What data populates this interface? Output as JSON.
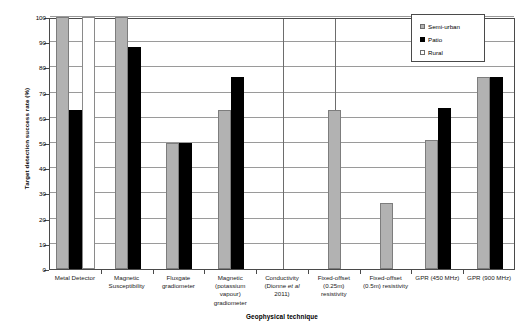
{
  "chart_data": {
    "type": "bar",
    "title": "",
    "xlabel": "Geophysical technique",
    "ylabel": "Target detection success rate (%)",
    "ylim": [
      0,
      100
    ],
    "ytick_step": 10,
    "yticks": [
      0,
      10,
      20,
      30,
      40,
      50,
      60,
      70,
      80,
      90,
      100
    ],
    "grid": true,
    "legend_position": "top-right",
    "categories": [
      "Metal Detector",
      "Magnetic Susceptibility",
      "Fluxgate gradiometer",
      "Magnetic (potassium vapour) gradiometer",
      "Conductivity (Dionne et al 2011)",
      "Fixed-offset (0.25m) resistivity",
      "Fixed-offset (0.5m) resistivity",
      "GPR (450 MHz)",
      "GPR (900 MHz)"
    ],
    "category_label_lines": [
      [
        "Metal Detector"
      ],
      [
        "Magnetic",
        "Susceptibility"
      ],
      [
        "Fluxgate",
        "gradiometer"
      ],
      [
        "Magnetic",
        "(potassium",
        "vapour)",
        "gradiometer"
      ],
      [
        "Conductivity",
        "(Dionne et al",
        "2011)"
      ],
      [
        "Fixed-offset",
        "(0.25m)",
        "resistivity"
      ],
      [
        "Fixed-offset",
        "(0.5m) resistivity"
      ],
      [
        "GPR (450 MHz)"
      ],
      [
        "GPR (900 MHz)"
      ]
    ],
    "series": [
      {
        "name": "Semi-urban",
        "color": "#b2b2b2",
        "values": [
          100,
          100,
          50,
          63,
          null,
          63,
          26,
          51,
          76
        ]
      },
      {
        "name": "Patio",
        "color": "#000000",
        "values": [
          63,
          88,
          50,
          76,
          null,
          null,
          null,
          64,
          76
        ]
      },
      {
        "name": "Rural",
        "color": "#ffffff",
        "values": [
          100,
          null,
          null,
          null,
          null,
          null,
          null,
          null,
          null
        ]
      }
    ],
    "group_separators": [
      4.5,
      5.5
    ]
  },
  "legend": {
    "entries": [
      {
        "label": "Semi-urban",
        "swatch": "semi"
      },
      {
        "label": "Patio",
        "swatch": "patio"
      },
      {
        "label": "Rural",
        "swatch": "rural"
      }
    ]
  }
}
